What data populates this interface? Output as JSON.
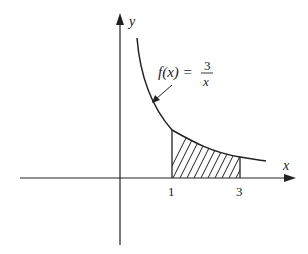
{
  "diagram": {
    "function": {
      "label_prefix": "f(x) = ",
      "numerator": "3",
      "denominator": "x"
    },
    "axes": {
      "x_label": "x",
      "y_label": "y"
    },
    "ticks": [
      {
        "value": 1,
        "label": "1"
      },
      {
        "value": 3,
        "label": "3"
      }
    ],
    "shaded_region": {
      "from": 1,
      "to": 3
    },
    "colors": {
      "line": "#222222",
      "background": "#ffffff"
    }
  }
}
